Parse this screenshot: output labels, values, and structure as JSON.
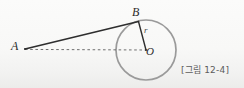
{
  "figure": {
    "caption": "[그림 12-4]",
    "background_color": "#f7f7f6",
    "labels": {
      "point_a": "A",
      "point_b": "B",
      "center_o": "O",
      "radius_r": "r"
    },
    "colors": {
      "circle_stroke": "#9a9a9a",
      "tangent_line": "#2e2e2e",
      "radius_line": "#2e2e2e",
      "dashed_line": "#6f6f6f",
      "label_text": "#2b2b2b",
      "caption_text": "#5c5c5c"
    },
    "geometry": {
      "circle_center_x": 146,
      "circle_center_y": 50,
      "circle_radius": 30,
      "point_a_x": 25,
      "point_a_y": 49,
      "point_b_x": 138,
      "point_b_y": 22,
      "tangent_segment": "A-B",
      "radius_segment": "B-O",
      "dashed_segment": "A-O"
    }
  }
}
